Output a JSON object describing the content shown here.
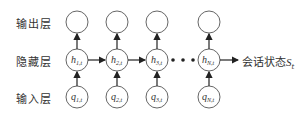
{
  "layers": {
    "output": "输出层",
    "hidden": "隐藏层",
    "input": "输入层"
  },
  "nodes": {
    "hidden": [
      {
        "base": "h",
        "sub": "1,t"
      },
      {
        "base": "h",
        "sub": "2,t"
      },
      {
        "base": "h",
        "sub": "3,t"
      },
      {
        "base": "h",
        "sub": "N,t"
      }
    ],
    "input": [
      {
        "base": "q",
        "sub": "1,t"
      },
      {
        "base": "q",
        "sub": "2,t"
      },
      {
        "base": "q",
        "sub": "3,t"
      },
      {
        "base": "q",
        "sub": "N,t"
      }
    ]
  },
  "ellipsis": "•••",
  "output_label": {
    "text": "会话状态",
    "symbol": "S",
    "sub": "t"
  }
}
